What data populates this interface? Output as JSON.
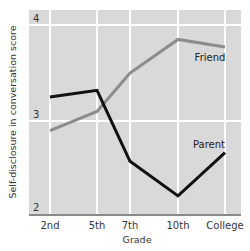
{
  "chart_data": {
    "type": "line",
    "title": "",
    "xlabel": "Grade",
    "ylabel": "Self-disclosure in conversation score",
    "categories": [
      "2nd",
      "5th",
      "7th",
      "10th",
      "College"
    ],
    "ylim": [
      2,
      4
    ],
    "yticks": [
      2,
      3,
      4
    ],
    "grid": true,
    "legend_position": "inline labels",
    "series": [
      {
        "name": "Friend",
        "color": "#8c8c8c",
        "values": [
          2.9,
          3.1,
          3.5,
          3.85,
          3.77
        ]
      },
      {
        "name": "Parent",
        "color": "#111111",
        "values": [
          3.25,
          3.32,
          2.58,
          2.22,
          2.67
        ]
      }
    ]
  },
  "colors": {
    "plot_bg": "#d9d9d9",
    "grid": "#ffffff",
    "axis": "#8a8a8a"
  }
}
